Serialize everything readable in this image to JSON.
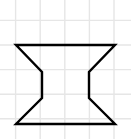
{
  "canvas": {
    "width": 131,
    "height": 139,
    "background_color": "#ffffff",
    "title": "Concave hexagonal shape on graph paper"
  },
  "grid": {
    "name": "graph-paper-grid",
    "line_color": "#e6e6e6",
    "line_width": 1.4,
    "spacing": 24.6,
    "x_lines": [
      15.6,
      40.2,
      64.8,
      89.4,
      114.0
    ],
    "y_lines": [
      20.4,
      45.0,
      69.6,
      94.2,
      118.8
    ],
    "visible": true
  },
  "shape": {
    "name": "concave-hexagon-hourglass",
    "type": "polygon",
    "stroke_color": "#000000",
    "stroke_width": 2.4,
    "fill": "none",
    "vertex_count": 8,
    "points": [
      [
        16,
        45
      ],
      [
        115,
        45
      ],
      [
        89,
        72
      ],
      [
        89,
        98
      ],
      [
        115,
        124
      ],
      [
        16,
        124
      ],
      [
        42,
        98
      ],
      [
        42,
        72
      ]
    ],
    "points_attr": "16,45 115,45 89,72 89,98 115,124 16,124 42,98 42,72",
    "edges": [
      {
        "name": "top-edge",
        "from": [
          16,
          45
        ],
        "to": [
          115,
          45
        ]
      },
      {
        "name": "upper-right-diagonal",
        "from": [
          115,
          45
        ],
        "to": [
          89,
          72
        ]
      },
      {
        "name": "right-waist-vertical",
        "from": [
          89,
          72
        ],
        "to": [
          89,
          98
        ]
      },
      {
        "name": "lower-right-diagonal",
        "from": [
          89,
          98
        ],
        "to": [
          115,
          124
        ]
      },
      {
        "name": "bottom-edge",
        "from": [
          115,
          124
        ],
        "to": [
          16,
          124
        ]
      },
      {
        "name": "lower-left-diagonal",
        "from": [
          16,
          124
        ],
        "to": [
          42,
          98
        ]
      },
      {
        "name": "left-waist-vertical",
        "from": [
          42,
          98
        ],
        "to": [
          42,
          72
        ]
      },
      {
        "name": "upper-left-diagonal",
        "from": [
          42,
          72
        ],
        "to": [
          16,
          45
        ]
      }
    ]
  }
}
